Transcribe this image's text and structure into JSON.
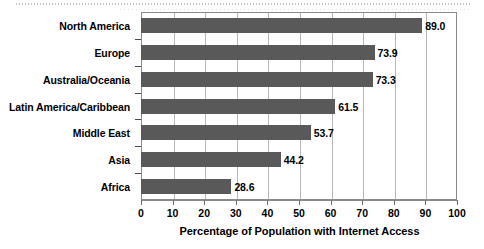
{
  "chart_data": {
    "type": "bar",
    "orientation": "horizontal",
    "title": "",
    "xlabel": "Percentage of Population with Internet Access",
    "ylabel": "",
    "categories": [
      "North America",
      "Europe",
      "Australia/Oceania",
      "Latin America/Caribbean",
      "Middle East",
      "Asia",
      "Africa"
    ],
    "values": [
      89.0,
      73.9,
      73.3,
      61.5,
      53.7,
      44.2,
      28.6
    ],
    "value_labels": [
      "89.0",
      "73.9",
      "73.3",
      "61.5",
      "53.7",
      "44.2",
      "28.6"
    ],
    "xlim": [
      0,
      100
    ],
    "xticks": [
      0,
      10,
      20,
      30,
      40,
      50,
      60,
      70,
      80,
      90,
      100
    ],
    "xtick_labels": [
      "0",
      "10",
      "20",
      "30",
      "40",
      "50",
      "60",
      "70",
      "80",
      "90",
      "100"
    ],
    "grid": true,
    "grid_axis": "x",
    "legend": null,
    "bar_color": "#595959",
    "grid_color": "#b8b8b8",
    "axis_color": "#8a8a8a",
    "background_color": "#ffffff"
  }
}
